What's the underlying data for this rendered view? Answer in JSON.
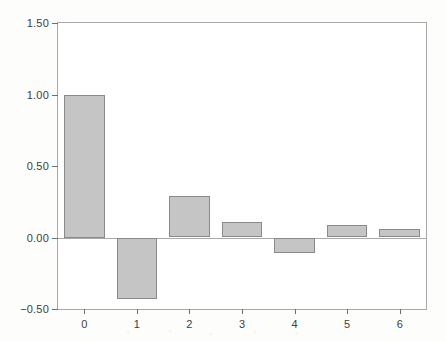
{
  "chart_data": {
    "type": "bar",
    "title": "",
    "subtitle": "",
    "xlabel": "",
    "ylabel": "",
    "categories": [
      "0",
      "1",
      "2",
      "3",
      "4",
      "5",
      "6"
    ],
    "values": [
      1.0,
      -0.43,
      0.29,
      0.11,
      -0.11,
      0.09,
      0.06
    ],
    "series": [
      {
        "name": "",
        "values": [
          1.0,
          -0.43,
          0.29,
          0.11,
          -0.11,
          0.09,
          0.06
        ]
      }
    ],
    "ylim": [
      -0.5,
      1.5
    ],
    "xlim": [
      -0.5,
      6.5
    ],
    "y_ticks": [
      1.5,
      1.0,
      0.5,
      0.0,
      -0.5
    ],
    "y_tick_labels": [
      "1.50",
      "1.00",
      "0.50",
      "0.00",
      "-0.50"
    ],
    "x_ticks": [
      0,
      1,
      2,
      3,
      4,
      5,
      6
    ],
    "x_tick_labels": [
      "0",
      "1",
      "2",
      "3",
      "4",
      "5",
      "6"
    ],
    "grid": false,
    "legend": null,
    "legend_position": "none",
    "annotations": [],
    "zero_line": 0.0,
    "bar_fill_color": "#c5c5c5",
    "bar_edge_color": "#8a8a8a",
    "axis_color": "#a9a9a9",
    "tick_label_color": "#3d3d3d",
    "plot_background": "#ffffff",
    "figure_background": "#fdfdfc",
    "bar_width_fraction": 0.77
  }
}
